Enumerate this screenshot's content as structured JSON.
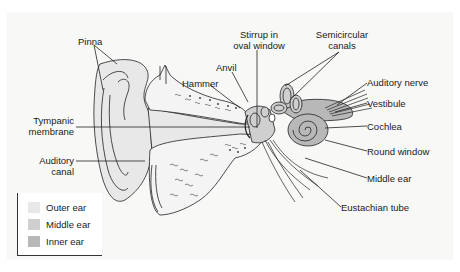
{
  "diagram": {
    "labels": {
      "pinna": "Pinna",
      "hammer": "Hammer",
      "anvil": "Anvil",
      "stirrup_line1": "Stirrup in",
      "stirrup_line2": "oval window",
      "semicircular_line1": "Semicircular",
      "semicircular_line2": "canals",
      "auditory_nerve": "Auditory nerve",
      "vestibule": "Vestibule",
      "cochlea": "Cochlea",
      "round_window": "Round window",
      "middle_ear": "Middle ear",
      "eustachian_tube": "Eustachian tube",
      "tympanic_line1": "Tympanic",
      "tympanic_line2": "membrane",
      "auditory_canal_line1": "Auditory",
      "auditory_canal_line2": "canal"
    },
    "legend": {
      "items": [
        {
          "label": "Outer ear",
          "color": "#e8e8e8"
        },
        {
          "label": "Middle ear",
          "color": "#cfcfcf"
        },
        {
          "label": "Inner ear",
          "color": "#b8b8b8"
        }
      ]
    },
    "colors": {
      "background": "#ffffff",
      "panel": "#f8f8f7",
      "outer_ear_fill": "#e8e8e8",
      "middle_ear_fill": "#cfcfcf",
      "inner_ear_fill": "#b8b8b8",
      "line": "#222222"
    }
  }
}
